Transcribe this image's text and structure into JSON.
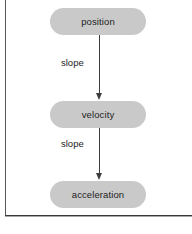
{
  "figure": {
    "type": "flow-diagram",
    "orientation": "vertical",
    "frame_color": "#3a3a3c",
    "background_color": "#ffffff"
  },
  "diagram": {
    "node_fill_color": "#c9c9c9",
    "node_text_color": "#1d1d1d",
    "arrow_color": "#3d3d3f",
    "nodes": [
      {
        "id": "position",
        "label": "position"
      },
      {
        "id": "velocity",
        "label": "velocity"
      },
      {
        "id": "acceleration",
        "label": "acceleration"
      }
    ],
    "edges": [
      {
        "from": "position",
        "to": "velocity",
        "label": "slope"
      },
      {
        "from": "velocity",
        "to": "acceleration",
        "label": "slope"
      }
    ]
  }
}
